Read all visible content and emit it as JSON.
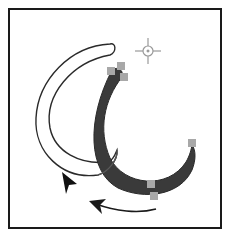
{
  "diagram": {
    "colors": {
      "background": "#ffffff",
      "frame": "#1a1a1a",
      "outline_stroke": "#2a2a2a",
      "filled_shape": "#3a3a3a",
      "anchor_handle": "#a8a8a8",
      "center_marker": "#999999",
      "arrow": "#1a1a1a"
    },
    "icons": {
      "pointer": "arrow-pointer-icon",
      "center": "center-point-crosshair-icon",
      "motion": "curved-motion-arrow-icon"
    },
    "handles": [
      {
        "x": 111,
        "y": 71
      },
      {
        "x": 121,
        "y": 66
      },
      {
        "x": 124,
        "y": 77
      },
      {
        "x": 192,
        "y": 143
      },
      {
        "x": 151,
        "y": 184
      },
      {
        "x": 154,
        "y": 196
      }
    ]
  }
}
